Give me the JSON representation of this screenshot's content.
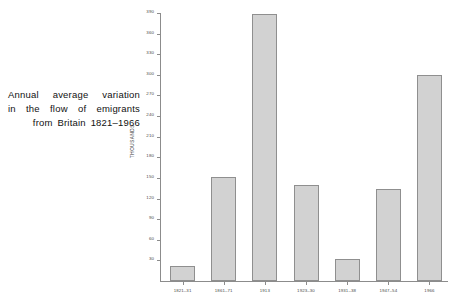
{
  "caption": {
    "line1": "Annual average variation",
    "line2": "in the flow of emigrants",
    "line3": "from Britain 1821–1966"
  },
  "chart_data": {
    "type": "bar",
    "title": "Annual average variation in the flow of emigrants from Britain 1821–1966",
    "xlabel": "",
    "ylabel": "THOUSANDS",
    "categories": [
      "1821–31",
      "1861–71",
      "1913",
      "1923–30",
      "1931–38",
      "1947–54",
      "1966"
    ],
    "values": [
      22,
      152,
      388,
      139,
      32,
      134,
      300
    ],
    "ylim": [
      0,
      390
    ],
    "ytick_values": [
      30,
      60,
      90,
      120,
      150,
      180,
      210,
      240,
      270,
      300,
      330,
      360,
      390
    ],
    "ytick_labels": [
      "30",
      "60",
      "90",
      "120",
      "150",
      "180",
      "210",
      "240",
      "270",
      "300",
      "330",
      "360",
      "390"
    ],
    "grid": false,
    "legend": false,
    "bar_fill": "#d2d2d2",
    "bar_edge": "#8f8f8f",
    "axis_color": "#8c8c8c"
  }
}
